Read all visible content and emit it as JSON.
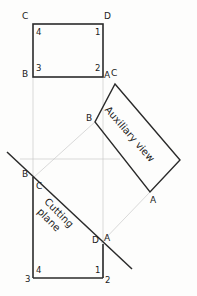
{
  "figure": {
    "background_color": "#fdfdfc",
    "line_color": "#1b1b1b",
    "construction_line_color": "#c9c9c9",
    "text_color": "#1b1b1b"
  },
  "annotations": {
    "auxiliary_view_label": "Auxiliary view",
    "cutting_plane_label_line1": "Cutting",
    "cutting_plane_label_line2": "plane"
  },
  "top_view": {
    "name": "top-view-rectangle",
    "corner_letters": {
      "top_left": "C",
      "top_right": "D",
      "bottom_left": "B",
      "bottom_right": "A"
    },
    "corner_numbers": {
      "top_left": "4",
      "top_right": "1",
      "bottom_left": "3",
      "bottom_right": "2"
    },
    "extra_letter_right": "C"
  },
  "front_view": {
    "name": "front-view-rectangle",
    "corner_letters": {
      "top_left": "B",
      "inner_top_left": "C",
      "inner_right": "D",
      "outer_right": "A"
    },
    "corner_numbers": {
      "bottom_left": "3",
      "inner_bottom_left": "4",
      "inner_bottom_right": "1",
      "bottom_right": "2"
    }
  },
  "auxiliary_view": {
    "name": "auxiliary-view-rectangle",
    "corner_letters": {
      "top_left": "A",
      "top_right": "C",
      "left": "B",
      "bottom_right": "A"
    }
  },
  "geometry": {
    "top_rect": {
      "x1": 33,
      "y1": 24,
      "x2": 103,
      "y2": 77
    },
    "front_rect": {
      "x1": 33,
      "y1": 177,
      "x2": 103,
      "y2": 278
    },
    "aux_rect_points": "115,84 180,160 150,192 95,122",
    "cutting_plane_line": {
      "x1": 7,
      "y1": 152,
      "x2": 132,
      "y2": 269
    }
  }
}
